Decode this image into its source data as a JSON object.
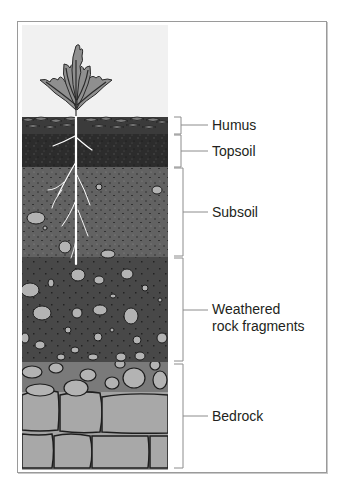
{
  "diagram": {
    "title": "",
    "type": "soil-profile",
    "layers": [
      {
        "id": "humus",
        "label": "Humus",
        "top": 116,
        "bottom": 134,
        "label_y": 125,
        "color": "#3a3a3a"
      },
      {
        "id": "topsoil",
        "label": "Topsoil",
        "top": 134,
        "bottom": 167,
        "label_y": 151,
        "color": "#2a2a2a"
      },
      {
        "id": "subsoil",
        "label": "Subsoil",
        "top": 167,
        "bottom": 257,
        "label_y": 212,
        "color": "#5e5e5e"
      },
      {
        "id": "weathered-rock",
        "label_line1": "Weathered",
        "label_line2": "rock fragments",
        "top": 257,
        "bottom": 362,
        "label_y": 310,
        "color": "#4a4a4a"
      },
      {
        "id": "bedrock",
        "label": "Bedrock",
        "top": 362,
        "bottom": 470,
        "label_y": 416,
        "color": "#a6a6a6"
      }
    ],
    "colors": {
      "sky": "#f1f1f1",
      "leaf": "#8f8f8f",
      "leaf_outline": "#2a2a2a",
      "root": "#ffffff",
      "rock": "#b3b3b3",
      "bracket": "#8c8c8c",
      "text": "#231f20"
    }
  }
}
